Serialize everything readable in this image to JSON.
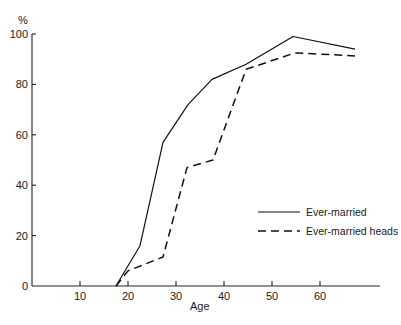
{
  "chart_data": {
    "type": "line",
    "title": "",
    "xlabel": "Age",
    "ylabel": "%",
    "xlim": [
      0,
      72
    ],
    "ylim": [
      0,
      100
    ],
    "x_ticks": [
      10,
      20,
      30,
      40,
      50,
      60
    ],
    "y_ticks": [
      0,
      20,
      40,
      60,
      80,
      100
    ],
    "grid": false,
    "legend_position": "right-center",
    "series": [
      {
        "name": "Ever-married",
        "style": "solid",
        "points": [
          [
            17.5,
            0
          ],
          [
            22.5,
            16
          ],
          [
            27.3,
            57
          ],
          [
            32.5,
            72
          ],
          [
            37.5,
            82
          ],
          [
            44.6,
            88
          ],
          [
            54.4,
            99
          ],
          [
            67.3,
            94
          ]
        ]
      },
      {
        "name": "Ever-married heads",
        "style": "dashed",
        "points": [
          [
            17.5,
            0
          ],
          [
            20,
            6
          ],
          [
            27.3,
            11.5
          ],
          [
            32.3,
            47
          ],
          [
            37.7,
            50
          ],
          [
            44.6,
            86
          ],
          [
            54.8,
            92.5
          ],
          [
            67.3,
            91.3
          ]
        ]
      }
    ]
  },
  "axes": {
    "y_unit": "%",
    "x_title": "Age",
    "y_tick_labels": [
      "0",
      "20",
      "40",
      "60",
      "80",
      "100"
    ],
    "x_tick_labels": [
      "10",
      "20",
      "30",
      "40",
      "50",
      "60"
    ]
  },
  "legend": {
    "items": [
      {
        "label": "Ever-married",
        "style": "solid"
      },
      {
        "label": "Ever-married heads",
        "style": "dashed"
      }
    ]
  }
}
